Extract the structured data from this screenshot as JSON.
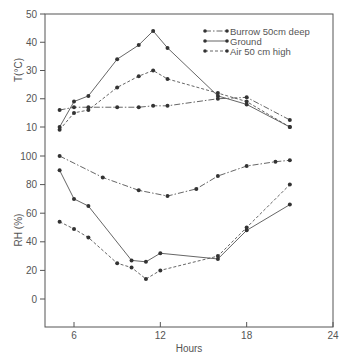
{
  "chart_data": {
    "type": "line",
    "title": "",
    "xlabel": "Hours",
    "xlim": [
      4,
      24
    ],
    "xticks": [
      6,
      12,
      18,
      24
    ],
    "legend": {
      "position": "upper right",
      "entries": [
        "Burrow 50cm deep",
        "Ground",
        "Air 50 cm high"
      ]
    },
    "panels": [
      {
        "name": "temperature",
        "ylabel": "T(°C)",
        "ylim": [
          10,
          50
        ],
        "yticks": [
          10,
          20,
          30,
          40,
          50
        ],
        "series": [
          {
            "name": "Burrow 50cm deep",
            "style": "dash-dot",
            "x": [
              5,
              6,
              7,
              9,
              10.5,
              11.5,
              12.5,
              16,
              18,
              21
            ],
            "y": [
              16,
              17,
              17,
              17,
              17,
              17.5,
              17.5,
              20,
              20.5,
              12.5
            ]
          },
          {
            "name": "Ground",
            "style": "solid",
            "x": [
              5,
              6,
              7,
              9,
              10.5,
              11.5,
              12.5,
              16,
              18,
              21
            ],
            "y": [
              10,
              19,
              21,
              34,
              39,
              44,
              38,
              21,
              18,
              10
            ]
          },
          {
            "name": "Air 50 cm high",
            "style": "dashed",
            "x": [
              5,
              6,
              7,
              9,
              10.5,
              11.5,
              12.5,
              16,
              18,
              21
            ],
            "y": [
              9,
              15,
              16,
              24,
              28,
              30,
              27,
              22,
              19,
              10
            ]
          }
        ]
      },
      {
        "name": "relative-humidity",
        "ylabel": "RH (%)",
        "ylim": [
          -20,
          100
        ],
        "yticks": [
          0,
          20,
          40,
          60,
          80,
          100
        ],
        "series": [
          {
            "name": "Burrow 50cm deep",
            "style": "dash-dot",
            "x": [
              5,
              8,
              10.5,
              12.5,
              14.5,
              16,
              18,
              20,
              21
            ],
            "y": [
              100,
              85,
              76,
              72,
              77,
              86,
              93,
              96,
              97
            ]
          },
          {
            "name": "Ground",
            "style": "solid",
            "x": [
              5,
              6,
              7,
              10,
              11,
              12,
              16,
              18,
              21
            ],
            "y": [
              90,
              70,
              65,
              27,
              26,
              32,
              28,
              48,
              66
            ]
          },
          {
            "name": "Air 50 cm high",
            "style": "dashed",
            "x": [
              5,
              6,
              7,
              9,
              10,
              11,
              12,
              16,
              18,
              21
            ],
            "y": [
              54,
              49,
              43,
              25,
              22,
              14,
              20,
              30,
              50,
              80
            ]
          }
        ]
      }
    ]
  }
}
